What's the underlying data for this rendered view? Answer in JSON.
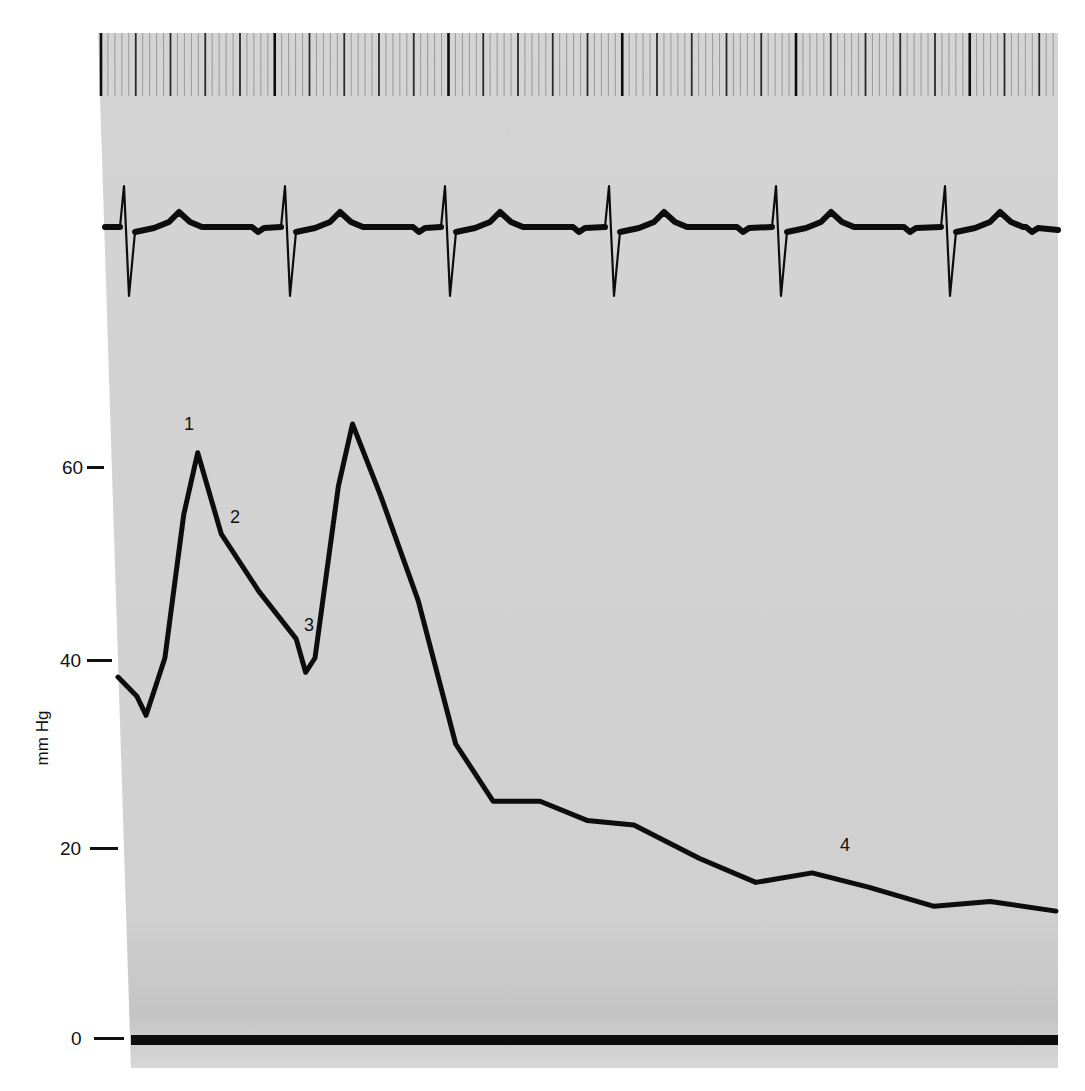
{
  "chart_data": {
    "type": "line",
    "title": "",
    "xlabel": "",
    "ylabel": "mm Hg",
    "ylim": [
      0,
      70
    ],
    "yticks": [
      0,
      20,
      40,
      60
    ],
    "ytick_labels": [
      "0",
      "20",
      "40",
      "60"
    ],
    "grid": false,
    "legend": null,
    "series": [
      {
        "name": "Time marker",
        "kind": "vertical tick marks",
        "description": "Timing lines along top strip with heavier marks at regular intervals"
      },
      {
        "name": "ECG",
        "kind": "electrocardiogram",
        "beats": 6,
        "beat_x_px": [
          124,
          285,
          445,
          609,
          776,
          945
        ]
      },
      {
        "name": "Pressure",
        "units": "mm Hg",
        "points": [
          {
            "t": 0.0,
            "p": 38
          },
          {
            "t": 0.02,
            "p": 36
          },
          {
            "t": 0.03,
            "p": 34
          },
          {
            "t": 0.05,
            "p": 40
          },
          {
            "t": 0.07,
            "p": 55
          },
          {
            "t": 0.085,
            "p": 61.5
          },
          {
            "t": 0.11,
            "p": 53
          },
          {
            "t": 0.15,
            "p": 47
          },
          {
            "t": 0.19,
            "p": 42
          },
          {
            "t": 0.2,
            "p": 38.5
          },
          {
            "t": 0.21,
            "p": 40
          },
          {
            "t": 0.235,
            "p": 58
          },
          {
            "t": 0.25,
            "p": 64.5
          },
          {
            "t": 0.28,
            "p": 57
          },
          {
            "t": 0.32,
            "p": 46
          },
          {
            "t": 0.36,
            "p": 31
          },
          {
            "t": 0.4,
            "p": 25
          },
          {
            "t": 0.45,
            "p": 25
          },
          {
            "t": 0.5,
            "p": 23
          },
          {
            "t": 0.55,
            "p": 22.5
          },
          {
            "t": 0.62,
            "p": 19
          },
          {
            "t": 0.68,
            "p": 16.5
          },
          {
            "t": 0.74,
            "p": 17.5
          },
          {
            "t": 0.8,
            "p": 16
          },
          {
            "t": 0.87,
            "p": 14
          },
          {
            "t": 0.93,
            "p": 14.5
          },
          {
            "t": 1.0,
            "p": 13.5
          }
        ]
      },
      {
        "name": "Zero baseline",
        "kind": "reference line",
        "value": 0
      }
    ],
    "annotations": [
      {
        "label": "1",
        "at": "first pressure peak (~61 mm Hg)"
      },
      {
        "label": "2",
        "at": "notch on descending limb (~53 mm Hg)"
      },
      {
        "label": "3",
        "at": "trough before second peak (~40 mm Hg)"
      },
      {
        "label": "4",
        "at": "late plateau (~17 mm Hg)"
      }
    ]
  },
  "axis": {
    "ylabel": "mm Hg",
    "ticks": [
      {
        "label": "60",
        "value": 60
      },
      {
        "label": "40",
        "value": 40
      },
      {
        "label": "20",
        "value": 20
      },
      {
        "label": "0",
        "value": 0
      }
    ]
  },
  "annotations": {
    "a1": "1",
    "a2": "2",
    "a3": "3",
    "a4": "4"
  },
  "colors": {
    "paper": "#d2d2d2",
    "trace": "#0d0d0d",
    "background": "#ffffff"
  }
}
